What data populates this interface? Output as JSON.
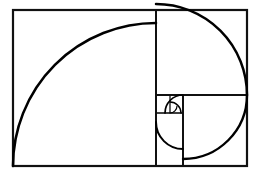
{
  "figure": {
    "type": "geometric-diagram",
    "background_color": "#ffffff",
    "line_color": "#111111",
    "spiral_color": "#000000",
    "canvas": {
      "width": 259,
      "height": 177
    }
  },
  "chart_data": {
    "type": "diagram",
    "outer_rectangle": {
      "x": 13,
      "y": 10,
      "width": 234,
      "height": 156,
      "stroke_width": 2.2
    },
    "squares": [
      {
        "name": "square-1",
        "order": 1,
        "fib": 13,
        "x": 13,
        "y": 10,
        "size_w": 143,
        "size_h": 156,
        "stroke_width": 2.2
      },
      {
        "name": "square-2",
        "order": 2,
        "fib": 8,
        "x": 156,
        "y": 10,
        "size_w": 91,
        "size_h": 85,
        "stroke_width": 2.0
      },
      {
        "name": "square-3",
        "order": 3,
        "fib": 5,
        "x": 183,
        "y": 95,
        "size_w": 64,
        "size_h": 71,
        "stroke_width": 2.0
      },
      {
        "name": "square-4",
        "order": 4,
        "fib": 3,
        "x": 156,
        "y": 95,
        "size_w": 27,
        "size_h": 27,
        "stroke_width": 1.6
      },
      {
        "name": "square-5",
        "order": 5,
        "fib": 2,
        "x": 156,
        "y": 95,
        "size_w": 27,
        "size_h": 18,
        "stroke_width": 1.4
      },
      {
        "name": "square-6",
        "order": 6,
        "fib": 1,
        "x": 170,
        "y": 95,
        "size_w": 13,
        "size_h": 18,
        "stroke_width": 1.2
      }
    ],
    "divider_lines": [
      {
        "name": "vertical-main-divider",
        "x1": 156,
        "y1": 10,
        "x2": 156,
        "y2": 166,
        "stroke_width": 2.0
      },
      {
        "name": "horizontal-right-divider",
        "x1": 156,
        "y1": 95,
        "x2": 247,
        "y2": 95,
        "stroke_width": 2.0
      },
      {
        "name": "vertical-inner-divider",
        "x1": 183,
        "y1": 95,
        "x2": 183,
        "y2": 166,
        "stroke_width": 2.0
      },
      {
        "name": "horizontal-small-divider",
        "x1": 156,
        "y1": 113,
        "x2": 183,
        "y2": 113,
        "stroke_width": 1.6
      },
      {
        "name": "vertical-tiny-divider",
        "x1": 170,
        "y1": 95,
        "x2": 170,
        "y2": 113,
        "stroke_width": 1.3
      }
    ],
    "spiral_arcs": [
      {
        "name": "arc-1",
        "order": 1,
        "center_x": 156,
        "center_y": 166,
        "radius": 143,
        "start_deg": 180,
        "end_deg": 270,
        "stroke_width": 2.6
      },
      {
        "name": "arc-2",
        "order": 2,
        "center_x": 156,
        "center_y": 95,
        "radius": 91,
        "start_deg": 270,
        "end_deg": 360,
        "stroke_width": 2.5
      },
      {
        "name": "arc-3",
        "order": 3,
        "center_x": 183,
        "center_y": 95,
        "radius": 64,
        "start_deg": 0,
        "end_deg": 90,
        "stroke_width": 2.4
      },
      {
        "name": "arc-4",
        "order": 4,
        "center_x": 183,
        "center_y": 122,
        "radius": 27,
        "start_deg": 90,
        "end_deg": 180,
        "stroke_width": 2.0
      },
      {
        "name": "arc-5",
        "order": 5,
        "center_x": 183,
        "center_y": 113,
        "radius": 18,
        "start_deg": 180,
        "end_deg": 270,
        "stroke_width": 1.7
      },
      {
        "name": "arc-6",
        "order": 6,
        "center_x": 170,
        "center_y": 113,
        "radius": 11,
        "start_deg": 270,
        "end_deg": 360,
        "stroke_width": 1.4
      },
      {
        "name": "arc-7",
        "order": 7,
        "center_x": 170,
        "center_y": 106,
        "radius": 7,
        "start_deg": 0,
        "end_deg": 90,
        "stroke_width": 1.2
      }
    ],
    "grid": false,
    "legend": null,
    "axis_labels": null,
    "tick_labels": null,
    "annotations": []
  }
}
